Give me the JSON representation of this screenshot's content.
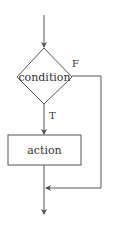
{
  "diagram": {
    "type": "flowchart",
    "nodes": [
      {
        "id": "condition",
        "shape": "diamond",
        "label": "condition"
      },
      {
        "id": "action",
        "shape": "rectangle",
        "label": "action"
      }
    ],
    "edge_labels": {
      "false_label": "F",
      "true_label": "T"
    },
    "edges": [
      {
        "from": "entry",
        "to": "condition"
      },
      {
        "from": "condition",
        "to": "action",
        "label": "T"
      },
      {
        "from": "condition",
        "to": "merge",
        "label": "F"
      },
      {
        "from": "action",
        "to": "merge"
      },
      {
        "from": "merge",
        "to": "exit"
      }
    ],
    "colors": {
      "stroke": "#555555",
      "text": "#333333",
      "background": "#ffffff"
    }
  }
}
